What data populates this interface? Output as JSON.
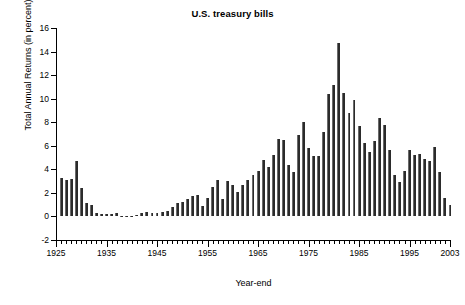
{
  "chart_data": {
    "type": "bar",
    "title": "U.S. treasury bills",
    "xlabel": "Year-end",
    "ylabel": "Total Annual Returns (in percent)",
    "ylim": [
      -2,
      16
    ],
    "xlim": [
      1925,
      2003
    ],
    "yticks": [
      -2,
      0,
      2,
      4,
      6,
      8,
      10,
      12,
      14,
      16
    ],
    "ytick_labels": [
      "-2",
      "0",
      "2",
      "4",
      "6",
      "8",
      "10",
      "12",
      "14",
      "16"
    ],
    "xticks_major": [
      1925,
      1935,
      1945,
      1955,
      1965,
      1975,
      1985,
      1995,
      2003
    ],
    "xtick_labels": [
      "1925",
      "1935",
      "1945",
      "1955",
      "1965",
      "1975",
      "1985",
      "1995",
      "2003"
    ],
    "grid": false,
    "legend": "none",
    "bar_color": "#2b2b2b",
    "categories": [
      1926,
      1927,
      1928,
      1929,
      1930,
      1931,
      1932,
      1933,
      1934,
      1935,
      1936,
      1937,
      1938,
      1939,
      1940,
      1941,
      1942,
      1943,
      1944,
      1945,
      1946,
      1947,
      1948,
      1949,
      1950,
      1951,
      1952,
      1953,
      1954,
      1955,
      1956,
      1957,
      1958,
      1959,
      1960,
      1961,
      1962,
      1963,
      1964,
      1965,
      1966,
      1967,
      1968,
      1969,
      1970,
      1971,
      1972,
      1973,
      1974,
      1975,
      1976,
      1977,
      1978,
      1979,
      1980,
      1981,
      1982,
      1983,
      1984,
      1985,
      1986,
      1987,
      1988,
      1989,
      1990,
      1991,
      1992,
      1993,
      1994,
      1995,
      1996,
      1997,
      1998,
      1999,
      2000,
      2001,
      2002,
      2003
    ],
    "values": [
      3.3,
      3.1,
      3.2,
      4.7,
      2.4,
      1.1,
      1.0,
      0.3,
      0.2,
      0.2,
      0.2,
      0.3,
      0.0,
      0.0,
      0.0,
      0.1,
      0.3,
      0.4,
      0.3,
      0.3,
      0.4,
      0.5,
      0.8,
      1.1,
      1.2,
      1.5,
      1.7,
      1.8,
      0.9,
      1.6,
      2.5,
      3.1,
      1.5,
      3.0,
      2.7,
      2.1,
      2.7,
      3.1,
      3.5,
      3.9,
      4.8,
      4.2,
      5.2,
      6.6,
      6.5,
      4.4,
      3.8,
      6.9,
      8.0,
      5.8,
      5.1,
      5.1,
      7.2,
      10.4,
      11.2,
      14.7,
      10.5,
      8.8,
      9.9,
      7.7,
      6.2,
      5.5,
      6.4,
      8.4,
      7.8,
      5.6,
      3.5,
      2.9,
      3.9,
      5.6,
      5.2,
      5.3,
      4.9,
      4.7,
      5.9,
      3.8,
      1.6,
      1.0
    ]
  }
}
